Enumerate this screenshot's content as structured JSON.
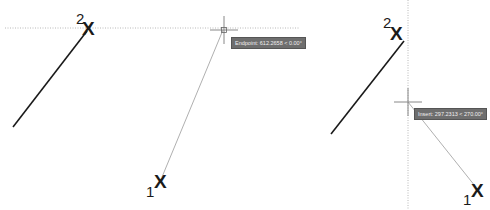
{
  "left_panel": {
    "point_2_label": "2",
    "point_1_label": "1",
    "marker": "X",
    "tooltip": "Endpoint: 612.2658 < 0.00°"
  },
  "right_panel": {
    "point_2_label": "2",
    "point_1_label": "1",
    "marker": "X",
    "tooltip": "Insert: 297.2313 < 270.00°"
  },
  "colors": {
    "solid_line": "#1a1a1a",
    "rubber_band": "#b0b0b0",
    "tracking_line": "#b8b8b8",
    "tooltip_bg": "#6e6e6e"
  }
}
